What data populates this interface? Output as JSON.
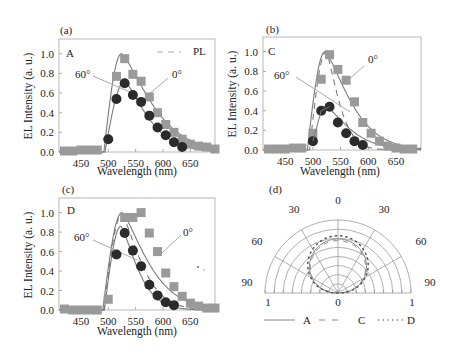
{
  "figure": {
    "panels": [
      {
        "id": "a",
        "panel_label": "(a)",
        "device_label": "A",
        "legend_label": "PL",
        "angle_labels": {
          "tilted": "60°",
          "normal": "0°"
        },
        "xlabel": "Wavelength (nm)",
        "ylabel": "EL Intensity (a. u.)",
        "xticks": [
          "450",
          "500",
          "550",
          "600",
          "650"
        ],
        "yticks": [
          "0.0",
          "0.2",
          "0.4",
          "0.6",
          "0.8",
          "1.0"
        ]
      },
      {
        "id": "b",
        "panel_label": "(b)",
        "device_label": "C",
        "angle_labels": {
          "tilted": "60°",
          "normal": "0°"
        },
        "xlabel": "Wavelength (nm)",
        "ylabel": "EL Intensity (a. u.)",
        "xticks": [
          "450",
          "500",
          "550",
          "600",
          "650"
        ],
        "yticks": [
          "0.0",
          "0.2",
          "0.4",
          "0.6",
          "0.8",
          "1.0"
        ]
      },
      {
        "id": "c",
        "panel_label": "(c)",
        "device_label": "D",
        "angle_labels": {
          "tilted": "60°",
          "normal": "0°"
        },
        "xlabel": "Wavelength (nm)",
        "ylabel": "EL Intensity (a. u.)",
        "xticks": [
          "450",
          "500",
          "550",
          "600",
          "650"
        ],
        "yticks": [
          "0.0",
          "0.2",
          "0.4",
          "0.6",
          "0.8",
          "1.0"
        ]
      },
      {
        "id": "d",
        "panel_label": "(d)",
        "angle_ticks": [
          "0",
          "30",
          "30",
          "60",
          "60",
          "90",
          "90"
        ],
        "radial_ticks": [
          "1",
          "0",
          "1"
        ],
        "legend": [
          {
            "label": "A",
            "style": "solid"
          },
          {
            "label": "C",
            "style": "dashed"
          },
          {
            "label": "D",
            "style": "dotted"
          }
        ]
      }
    ]
  },
  "colors": {
    "square_marker": "#9a9a9a",
    "circle_marker": "#2b2b2b",
    "curve": "#7a7a7a",
    "frame": "#b8b8b8",
    "polar_grid": "#9a9a9a"
  },
  "chart_data": [
    {
      "type": "scatter",
      "title": "(a) A",
      "xlabel": "Wavelength (nm)",
      "ylabel": "EL Intensity (a. u.)",
      "xlim": [
        410,
        695
      ],
      "ylim": [
        0,
        1.15
      ],
      "grid": false,
      "series": [
        {
          "name": "0°",
          "marker": "square",
          "x": [
            420,
            435,
            450,
            465,
            480,
            515,
            530,
            545,
            560,
            575,
            590,
            605,
            620,
            635,
            650,
            665,
            680,
            695
          ],
          "y": [
            0.01,
            0.01,
            0.02,
            0.02,
            0.02,
            0.77,
            0.95,
            0.79,
            0.72,
            0.56,
            0.4,
            0.28,
            0.2,
            0.13,
            0.08,
            0.06,
            0.05,
            0.03
          ]
        },
        {
          "name": "60°",
          "marker": "circle",
          "x": [
            500,
            515,
            530,
            545,
            560,
            575,
            590,
            605,
            620,
            635
          ],
          "y": [
            0.13,
            0.54,
            0.7,
            0.58,
            0.51,
            0.37,
            0.25,
            0.17,
            0.1,
            0.05
          ]
        },
        {
          "name": "PL",
          "style": "dashed",
          "x": [
            490,
            500,
            510,
            520,
            525,
            535,
            550,
            575,
            600,
            625,
            650,
            675,
            695
          ],
          "y": [
            0.0,
            0.55,
            0.9,
            1.0,
            1.0,
            0.95,
            0.8,
            0.55,
            0.32,
            0.17,
            0.08,
            0.03,
            0.01
          ]
        }
      ]
    },
    {
      "type": "scatter",
      "title": "(b) C",
      "xlabel": "Wavelength (nm)",
      "ylabel": "EL Intensity (a. u.)",
      "xlim": [
        410,
        695
      ],
      "ylim": [
        0,
        1.15
      ],
      "grid": false,
      "series": [
        {
          "name": "0°",
          "marker": "square",
          "x": [
            420,
            435,
            450,
            465,
            480,
            500,
            515,
            530,
            545,
            560,
            575,
            590,
            605,
            620,
            635,
            650,
            665,
            680
          ],
          "y": [
            0.01,
            0.01,
            0.01,
            0.02,
            0.02,
            0.17,
            0.72,
            0.97,
            0.82,
            0.71,
            0.49,
            0.28,
            0.17,
            0.09,
            0.04,
            0.02,
            0.01,
            0.01
          ]
        },
        {
          "name": "60°",
          "marker": "circle",
          "x": [
            500,
            515,
            530,
            545,
            560,
            575,
            590
          ],
          "y": [
            0.09,
            0.4,
            0.44,
            0.28,
            0.17,
            0.09,
            0.05
          ]
        },
        {
          "name": "PL",
          "style": "dashed",
          "x": [
            490,
            500,
            510,
            520,
            525,
            535,
            550,
            565,
            580,
            600,
            620
          ],
          "y": [
            0.0,
            0.6,
            0.92,
            1.0,
            1.0,
            0.9,
            0.62,
            0.35,
            0.15,
            0.05,
            0.01
          ]
        }
      ]
    },
    {
      "type": "scatter",
      "title": "(c) D",
      "xlabel": "Wavelength (nm)",
      "ylabel": "EL Intensity (a. u.)",
      "xlim": [
        410,
        695
      ],
      "ylim": [
        0,
        1.15
      ],
      "grid": false,
      "series": [
        {
          "name": "0°",
          "marker": "square",
          "x": [
            420,
            435,
            450,
            465,
            480,
            500,
            530,
            545,
            560,
            575,
            590,
            605,
            620,
            635,
            650,
            665,
            680,
            695
          ],
          "y": [
            0.01,
            0.0,
            0.0,
            0.0,
            0.0,
            0.11,
            0.95,
            0.95,
            1.0,
            0.79,
            0.6,
            0.38,
            0.24,
            0.14,
            0.07,
            0.04,
            0.02,
            0.02
          ]
        },
        {
          "name": "60°",
          "marker": "circle",
          "x": [
            515,
            530,
            545,
            560,
            575,
            590,
            605,
            620
          ],
          "y": [
            0.57,
            0.79,
            0.61,
            0.45,
            0.26,
            0.15,
            0.08,
            0.05
          ]
        },
        {
          "name": "PL",
          "style": "dashed",
          "x": [
            490,
            500,
            510,
            520,
            525,
            535,
            550,
            575,
            600,
            625,
            650
          ],
          "y": [
            0.0,
            0.55,
            0.9,
            1.0,
            1.0,
            0.92,
            0.7,
            0.4,
            0.17,
            0.05,
            0.01
          ]
        }
      ]
    },
    {
      "type": "polar",
      "title": "(d)",
      "theta_ticks_deg": [
        -90,
        -60,
        -30,
        0,
        30,
        60,
        90
      ],
      "theta_labels": [
        "90",
        "60",
        "30",
        "0",
        "30",
        "60",
        "90"
      ],
      "r_range": [
        0,
        1
      ],
      "legend_position": "bottom",
      "series": [
        {
          "name": "A",
          "style": "solid",
          "theta_deg": [
            -90,
            -60,
            -30,
            0,
            30,
            60,
            90
          ],
          "r": [
            0.0,
            0.52,
            0.86,
            1.0,
            0.86,
            0.52,
            0.0
          ]
        },
        {
          "name": "C",
          "style": "dashed",
          "theta_deg": [
            -90,
            -60,
            -30,
            0,
            30,
            60,
            90
          ],
          "r": [
            0.0,
            0.48,
            0.84,
            0.97,
            0.84,
            0.48,
            0.0
          ]
        },
        {
          "name": "D",
          "style": "dotted",
          "theta_deg": [
            -90,
            -60,
            -30,
            0,
            30,
            60,
            90
          ],
          "r": [
            0.0,
            0.56,
            0.93,
            1.06,
            0.93,
            0.56,
            0.0
          ]
        }
      ]
    }
  ]
}
